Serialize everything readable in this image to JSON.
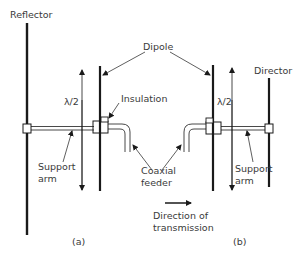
{
  "labels": {
    "reflector": "Reflector",
    "dipole": "Dipole",
    "director": "Director",
    "insulation": "Insulation",
    "half_wave_a": "λ/2",
    "half_wave_b": "λ/2",
    "support_arm_a_line1": "Support",
    "support_arm_a_line2": "arm",
    "support_arm_b_line1": "Support",
    "support_arm_b_line2": "arm",
    "coaxial_line1": "Coaxial",
    "coaxial_line2": "feeder",
    "direction_line1": "Direction of",
    "direction_line2": "transmission",
    "panel_a": "(a)",
    "panel_b": "(b)"
  },
  "colors": {
    "stroke": "#1a1a1a",
    "text": "#3a3a3a",
    "background": "#ffffff"
  }
}
